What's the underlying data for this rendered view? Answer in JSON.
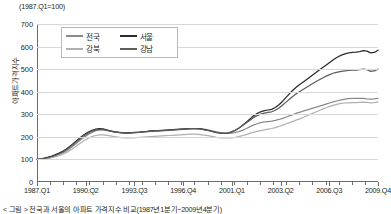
{
  "chart_data": {
    "type": "line",
    "title": "",
    "unit_note": "(1987.Q1=100)",
    "xlabel": "",
    "ylabel": "아파트가격지수",
    "ylim": [
      0,
      700
    ],
    "ytick_labels": [
      "700",
      "600",
      "500",
      "400",
      "300",
      "200",
      "100",
      "0"
    ],
    "yticks": [
      700,
      600,
      500,
      400,
      300,
      200,
      100,
      0
    ],
    "grid": true,
    "legend_position": "top-left-inside",
    "xtick_labels": [
      "1987.Q1",
      "1990.Q2",
      "1993.Q3",
      "1996.Q4",
      "2001.Q1",
      "2003.Q2",
      "2006.Q3",
      "2009.Q4"
    ],
    "xlim": [
      0,
      91
    ],
    "x_index": [
      0,
      13,
      26,
      39,
      52,
      65,
      78,
      91
    ],
    "series": [
      {
        "name": "전국",
        "color": "#8a8a8a",
        "values": [
          100,
          102,
          104,
          107,
          111,
          116,
          122,
          129,
          138,
          149,
          162,
          175,
          188,
          200,
          211,
          220,
          227,
          231,
          232,
          229,
          225,
          222,
          220,
          219,
          218,
          218,
          219,
          220,
          221,
          222,
          223,
          224,
          225,
          226,
          227,
          228,
          229,
          230,
          231,
          232,
          233,
          234,
          235,
          236,
          236,
          235,
          233,
          230,
          226,
          222,
          219,
          217,
          216,
          217,
          219,
          223,
          229,
          236,
          244,
          252,
          258,
          263,
          266,
          268,
          270,
          273,
          277,
          282,
          288,
          294,
          300,
          306,
          311,
          316,
          321,
          326,
          331,
          336,
          341,
          346,
          351,
          356,
          360,
          364,
          367,
          369,
          370,
          371,
          371,
          370,
          368,
          367,
          368,
          370
        ]
      },
      {
        "name": "서울",
        "color": "#2b2b2b",
        "values": [
          100,
          103,
          106,
          110,
          115,
          121,
          128,
          136,
          146,
          158,
          172,
          186,
          199,
          211,
          221,
          229,
          234,
          236,
          235,
          231,
          227,
          223,
          221,
          219,
          218,
          218,
          219,
          220,
          221,
          223,
          224,
          226,
          227,
          228,
          229,
          230,
          231,
          232,
          233,
          234,
          235,
          236,
          237,
          237,
          236,
          234,
          231,
          227,
          223,
          219,
          217,
          216,
          217,
          221,
          228,
          238,
          250,
          264,
          278,
          292,
          303,
          311,
          316,
          319,
          322,
          330,
          342,
          358,
          376,
          394,
          410,
          424,
          436,
          448,
          460,
          472,
          484,
          496,
          508,
          520,
          532,
          544,
          554,
          562,
          568,
          572,
          574,
          575,
          578,
          582,
          580,
          572,
          574,
          584
        ]
      },
      {
        "name": "강북",
        "color": "#b0b0b0",
        "values": [
          100,
          101,
          103,
          105,
          108,
          112,
          117,
          123,
          131,
          140,
          151,
          163,
          174,
          185,
          194,
          201,
          206,
          209,
          209,
          207,
          204,
          201,
          199,
          197,
          196,
          196,
          196,
          197,
          198,
          199,
          200,
          201,
          202,
          203,
          204,
          205,
          206,
          207,
          208,
          209,
          210,
          211,
          212,
          212,
          211,
          209,
          207,
          204,
          201,
          198,
          196,
          195,
          195,
          196,
          198,
          201,
          205,
          210,
          215,
          220,
          224,
          228,
          231,
          234,
          237,
          241,
          246,
          252,
          258,
          264,
          270,
          276,
          282,
          289,
          296,
          303,
          310,
          317,
          324,
          330,
          336,
          341,
          345,
          348,
          350,
          351,
          352,
          352,
          353,
          354,
          353,
          351,
          352,
          355
        ]
      },
      {
        "name": "강남",
        "color": "#5c5c5c",
        "values": [
          100,
          102,
          105,
          108,
          112,
          118,
          125,
          133,
          143,
          155,
          168,
          182,
          195,
          207,
          217,
          225,
          230,
          232,
          232,
          229,
          225,
          222,
          220,
          218,
          217,
          217,
          218,
          219,
          220,
          222,
          223,
          225,
          226,
          227,
          228,
          229,
          230,
          231,
          232,
          233,
          234,
          235,
          236,
          236,
          235,
          233,
          230,
          227,
          223,
          220,
          218,
          217,
          218,
          222,
          229,
          238,
          249,
          261,
          273,
          285,
          294,
          301,
          305,
          308,
          311,
          318,
          328,
          341,
          355,
          369,
          382,
          394,
          404,
          414,
          424,
          434,
          444,
          453,
          462,
          470,
          477,
          483,
          487,
          490,
          492,
          494,
          496,
          496,
          498,
          500,
          498,
          490,
          492,
          500
        ]
      }
    ]
  },
  "legend": {
    "items": [
      {
        "label": "전국",
        "color": "#8a8a8a"
      },
      {
        "label": "서울",
        "color": "#2b2b2b"
      },
      {
        "label": "강북",
        "color": "#b0b0b0"
      },
      {
        "label": "강남",
        "color": "#5c5c5c"
      }
    ]
  },
  "caption": "< 그림 > 전국과 서울의 아파트 가격지수 비교(1987년1분기~2009년4분기)"
}
